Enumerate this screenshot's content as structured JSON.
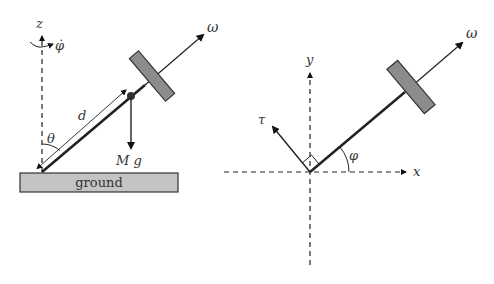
{
  "left_panel": {
    "ground_label": "ground",
    "z_axis_label": "z",
    "phi_dot_label": "φ̇",
    "omega_label": "ω",
    "distance_label": "d",
    "theta_label": "θ",
    "weight_label": "M g"
  },
  "right_panel": {
    "x_axis_label": "x",
    "y_axis_label": "y",
    "omega_label": "ω",
    "tau_label": "τ",
    "phi_label": "φ"
  },
  "colors": {
    "line": "#222222",
    "disk_fill": "#8c8c8c",
    "ground_fill": "#c4c4c4",
    "text": "#333333"
  }
}
